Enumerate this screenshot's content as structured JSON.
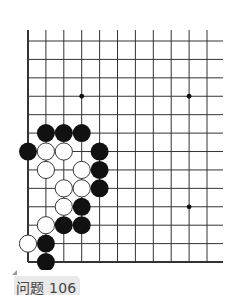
{
  "diagram": {
    "type": "go-problem",
    "board_visible": {
      "columns": 11,
      "rows": 13,
      "left_edge": true,
      "bottom_edge": true,
      "origin_x": 28,
      "origin_y": 41,
      "col_spacing": 17.9,
      "row_spacing": 18.42,
      "right_extent": 223,
      "top_extent": 30
    },
    "star_points": [
      [
        3,
        3
      ],
      [
        9,
        3
      ],
      [
        9,
        9
      ]
    ],
    "stones": {
      "black": [
        [
          1,
          5
        ],
        [
          2,
          5
        ],
        [
          3,
          5
        ],
        [
          0,
          6
        ],
        [
          4,
          6
        ],
        [
          4,
          7
        ],
        [
          4,
          8
        ],
        [
          3,
          9
        ],
        [
          2,
          10
        ],
        [
          3,
          10
        ],
        [
          1,
          11
        ],
        [
          1,
          12
        ]
      ],
      "white": [
        [
          1,
          6
        ],
        [
          2,
          6
        ],
        [
          1,
          7
        ],
        [
          3,
          7
        ],
        [
          2,
          8
        ],
        [
          3,
          8
        ],
        [
          2,
          9
        ],
        [
          1,
          10
        ],
        [
          0,
          11
        ]
      ]
    },
    "colors": {
      "line": "#333333",
      "black_stone": "#111111",
      "white_stone": "#ffffff",
      "label_bg": "#e9e9e9"
    }
  },
  "caption": {
    "label": "问题 106"
  }
}
